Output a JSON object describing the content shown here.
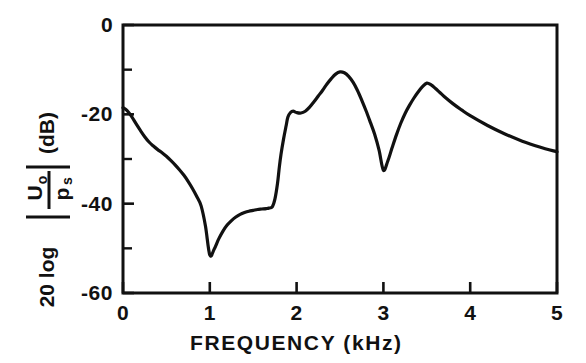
{
  "figure": {
    "background_color": "#ffffff",
    "line_color": "#111111",
    "axis_color": "#111111"
  },
  "axes": {
    "x": {
      "title": "FREQUENCY (kHz)",
      "unit": "kHz",
      "min": 0,
      "max": 5,
      "tick_values": [
        0,
        1,
        2,
        3,
        4,
        5
      ],
      "tick_labels": [
        "0",
        "1",
        "2",
        "3",
        "4",
        "5"
      ]
    },
    "y": {
      "title_parts": {
        "prefix": "20 log",
        "numerator": "U",
        "numerator_sub": "o",
        "denominator": "p",
        "denominator_sub": "s",
        "unit": "(dB)"
      },
      "title_plain": "20 log |Uo/ps| (dB)",
      "min": -60,
      "max": 0,
      "tick_values": [
        0,
        -20,
        -40,
        -60
      ],
      "tick_labels": [
        "0",
        "-20",
        "-40",
        "-60"
      ],
      "minor_tick_values": [
        -10,
        -30,
        -50
      ]
    }
  },
  "chart_data": {
    "type": "line",
    "title": "",
    "subtitle": "",
    "xlabel": "FREQUENCY (kHz)",
    "ylabel": "20 log |Uo/ps| (dB)",
    "xlim": [
      0,
      5
    ],
    "ylim": [
      -60,
      0
    ],
    "grid": false,
    "legend": null,
    "annotations": [],
    "series": [
      {
        "name": "magnitude response",
        "x": [
          0.0,
          0.05,
          0.1,
          0.15,
          0.2,
          0.25,
          0.3,
          0.35,
          0.4,
          0.45,
          0.5,
          0.55,
          0.6,
          0.65,
          0.7,
          0.75,
          0.8,
          0.85,
          0.9,
          0.95,
          1.0,
          1.05,
          1.1,
          1.15,
          1.2,
          1.25,
          1.3,
          1.35,
          1.4,
          1.45,
          1.5,
          1.55,
          1.6,
          1.65,
          1.68,
          1.72,
          1.75,
          1.78,
          1.8,
          1.82,
          1.85,
          1.88,
          1.9,
          1.93,
          1.96,
          2.0,
          2.05,
          2.1,
          2.15,
          2.2,
          2.25,
          2.3,
          2.35,
          2.4,
          2.45,
          2.5,
          2.55,
          2.6,
          2.65,
          2.7,
          2.75,
          2.8,
          2.85,
          2.9,
          2.95,
          3.0,
          3.05,
          3.1,
          3.15,
          3.2,
          3.25,
          3.3,
          3.35,
          3.4,
          3.45,
          3.5,
          3.55,
          3.6,
          3.65,
          3.7,
          3.8,
          3.9,
          4.0,
          4.2,
          4.4,
          4.6,
          4.8,
          5.0
        ],
        "y": [
          -18.5,
          -19.2,
          -20.5,
          -22.1,
          -23.6,
          -25.0,
          -26.2,
          -27.1,
          -27.9,
          -28.6,
          -29.4,
          -30.3,
          -31.3,
          -32.4,
          -33.6,
          -35.0,
          -36.6,
          -38.4,
          -40.5,
          -45.0,
          -51.5,
          -50.2,
          -48.0,
          -46.2,
          -44.8,
          -43.8,
          -43.0,
          -42.4,
          -42.0,
          -41.7,
          -41.5,
          -41.3,
          -41.2,
          -41.1,
          -41.0,
          -40.7,
          -39.0,
          -35.5,
          -32.0,
          -29.0,
          -25.5,
          -22.5,
          -20.6,
          -19.6,
          -19.3,
          -19.6,
          -19.7,
          -19.3,
          -18.4,
          -17.2,
          -15.9,
          -14.6,
          -13.2,
          -12.0,
          -11.0,
          -10.5,
          -10.7,
          -11.5,
          -12.8,
          -14.6,
          -16.8,
          -19.2,
          -21.8,
          -24.5,
          -28.0,
          -32.5,
          -30.5,
          -27.5,
          -24.6,
          -22.0,
          -19.8,
          -18.0,
          -16.4,
          -15.0,
          -13.8,
          -13.0,
          -13.4,
          -14.2,
          -15.1,
          -16.0,
          -17.6,
          -19.0,
          -20.3,
          -22.5,
          -24.4,
          -26.0,
          -27.3,
          -28.4
        ]
      }
    ],
    "key_points": [
      {
        "label": "start",
        "x": 0.0,
        "y": -18.5
      },
      {
        "label": "antiresonance dip",
        "x": 1.0,
        "y": -51.5
      },
      {
        "label": "plateau",
        "x": 1.6,
        "y": -41.2
      },
      {
        "label": "shoulder",
        "x": 1.93,
        "y": -19.6
      },
      {
        "label": "first resonance peak",
        "x": 2.5,
        "y": -10.5
      },
      {
        "label": "notch",
        "x": 3.0,
        "y": -32.5
      },
      {
        "label": "second resonance peak",
        "x": 3.5,
        "y": -13.0
      },
      {
        "label": "end",
        "x": 5.0,
        "y": -28.4
      }
    ]
  },
  "geometry": {
    "plot_left": 123,
    "plot_right": 557,
    "plot_top": 25,
    "plot_bottom": 293
  }
}
